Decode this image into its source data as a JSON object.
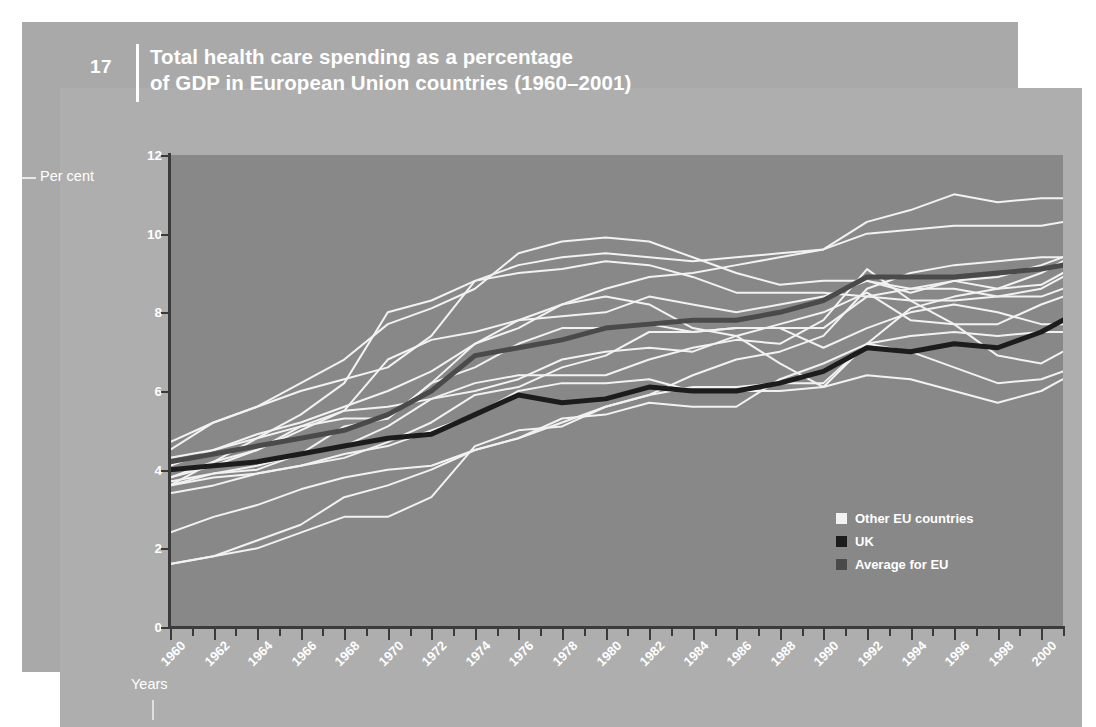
{
  "header": {
    "number": "17",
    "title_line1": "Total health care spending as a percentage",
    "title_line2": "of GDP in European Union countries (1960–2001)"
  },
  "axes": {
    "ylabel": "Per cent",
    "xlabel": "Years"
  },
  "legend": {
    "items": [
      {
        "label": "Other EU countries",
        "color": "#f2f2f2"
      },
      {
        "label": "UK",
        "color": "#1c1c1c"
      },
      {
        "label": "Average for EU",
        "color": "#4a4a4a"
      }
    ]
  },
  "colors": {
    "page_background": "#ffffff",
    "back_panel": "#a9a9a9",
    "front_panel": "#aeaeae",
    "plot_background": "#888888",
    "axis": "#3b3b3b",
    "text": "#ffffff",
    "other_countries": "#f2f2f2",
    "uk": "#1c1c1c",
    "eu_average": "#4a4a4a"
  },
  "chart_data": {
    "type": "line",
    "title": "Total health care spending as a percentage of GDP in European Union countries (1960–2001)",
    "xlabel": "Years",
    "ylabel": "Per cent",
    "xlim": [
      1960,
      2001
    ],
    "ylim": [
      0,
      12
    ],
    "yticks": [
      0,
      2,
      4,
      6,
      8,
      10,
      12
    ],
    "xticks": [
      1960,
      1962,
      1964,
      1966,
      1968,
      1970,
      1972,
      1974,
      1976,
      1978,
      1980,
      1982,
      1984,
      1986,
      1988,
      1990,
      1992,
      1994,
      1996,
      1998,
      2000
    ],
    "xtick_labels": [
      "1960",
      "1962",
      "1964",
      "1966",
      "1968",
      "1970",
      "1972",
      "1974",
      "1976",
      "1978",
      "1980",
      "1982",
      "1984",
      "1986",
      "1988",
      "1990",
      "1992",
      "1994",
      "1996",
      "1998",
      "2000"
    ],
    "grid": false,
    "legend_position": "lower right",
    "x": [
      1960,
      1962,
      1964,
      1966,
      1968,
      1970,
      1972,
      1974,
      1976,
      1978,
      1980,
      1982,
      1984,
      1986,
      1988,
      1990,
      1992,
      1994,
      1996,
      1998,
      2000,
      2001
    ],
    "series": [
      {
        "name": "UK",
        "group": "uk",
        "color": "#1c1c1c",
        "width": 5,
        "values": [
          4.0,
          4.1,
          4.2,
          4.4,
          4.6,
          4.8,
          4.9,
          5.4,
          5.9,
          5.7,
          5.8,
          6.1,
          6.0,
          6.0,
          6.2,
          6.5,
          7.1,
          7.0,
          7.2,
          7.1,
          7.5,
          7.8
        ]
      },
      {
        "name": "Average for EU",
        "group": "eu_average",
        "color": "#4a4a4a",
        "width": 5,
        "values": [
          4.2,
          4.4,
          4.6,
          4.8,
          5.0,
          5.4,
          6.0,
          6.9,
          7.1,
          7.3,
          7.6,
          7.7,
          7.8,
          7.8,
          8.0,
          8.3,
          8.9,
          8.9,
          8.9,
          9.0,
          9.1,
          9.2
        ]
      },
      {
        "name": "Germany",
        "group": "other",
        "color": "#f2f2f2",
        "width": 2,
        "values": [
          4.7,
          5.2,
          5.6,
          6.0,
          6.3,
          6.6,
          7.4,
          8.8,
          9.2,
          9.4,
          9.5,
          9.4,
          9.3,
          9.4,
          9.5,
          9.6,
          10.3,
          10.6,
          11.0,
          10.8,
          10.9,
          10.9
        ]
      },
      {
        "name": "France",
        "group": "other",
        "color": "#f2f2f2",
        "width": 2,
        "values": [
          4.1,
          4.5,
          4.9,
          5.2,
          5.6,
          6.0,
          6.5,
          7.2,
          7.8,
          8.2,
          8.6,
          8.9,
          9.0,
          9.2,
          9.4,
          9.6,
          10.0,
          10.1,
          10.2,
          10.2,
          10.2,
          10.3
        ]
      },
      {
        "name": "Sweden",
        "group": "other",
        "color": "#f2f2f2",
        "width": 2,
        "values": [
          4.5,
          5.2,
          5.6,
          6.2,
          6.8,
          7.7,
          8.1,
          8.6,
          9.5,
          9.8,
          9.9,
          9.8,
          9.4,
          9.0,
          8.7,
          8.8,
          8.8,
          8.5,
          8.8,
          8.9,
          9.2,
          9.4
        ]
      },
      {
        "name": "Denmark",
        "group": "other",
        "color": "#f2f2f2",
        "width": 2,
        "values": [
          3.6,
          4.2,
          4.8,
          5.4,
          6.2,
          8.0,
          8.3,
          8.8,
          9.0,
          9.1,
          9.3,
          9.2,
          8.9,
          8.5,
          8.5,
          8.5,
          8.4,
          8.3,
          8.3,
          8.4,
          8.4,
          8.6
        ]
      },
      {
        "name": "Netherlands",
        "group": "other",
        "color": "#f2f2f2",
        "width": 2,
        "values": [
          3.8,
          4.1,
          4.5,
          5.0,
          5.5,
          6.8,
          7.3,
          7.5,
          7.8,
          7.9,
          8.0,
          8.4,
          8.2,
          8.0,
          8.2,
          8.4,
          8.8,
          8.6,
          8.6,
          8.4,
          8.6,
          8.9
        ]
      },
      {
        "name": "Belgium",
        "group": "other",
        "color": "#f2f2f2",
        "width": 2,
        "values": [
          3.4,
          3.6,
          3.9,
          4.1,
          4.3,
          4.7,
          5.2,
          5.9,
          6.1,
          6.6,
          6.9,
          7.5,
          7.5,
          7.6,
          7.6,
          7.6,
          8.4,
          8.6,
          8.8,
          8.6,
          8.7,
          9.0
        ]
      },
      {
        "name": "Austria",
        "group": "other",
        "color": "#f2f2f2",
        "width": 2,
        "values": [
          4.3,
          4.5,
          4.8,
          5.1,
          5.3,
          5.3,
          6.2,
          6.6,
          7.2,
          7.6,
          7.6,
          7.7,
          7.5,
          7.6,
          7.6,
          7.1,
          7.6,
          8.0,
          8.2,
          8.0,
          7.7,
          7.7
        ]
      },
      {
        "name": "Italy",
        "group": "other",
        "color": "#f2f2f2",
        "width": 2,
        "values": [
          3.6,
          3.9,
          4.1,
          4.4,
          4.6,
          5.1,
          5.8,
          6.0,
          6.3,
          6.8,
          7.0,
          7.1,
          7.0,
          7.4,
          7.7,
          8.0,
          8.5,
          7.8,
          7.7,
          7.7,
          8.2,
          8.4
        ]
      },
      {
        "name": "Finland",
        "group": "other",
        "color": "#f2f2f2",
        "width": 2,
        "values": [
          3.8,
          4.2,
          4.5,
          5.1,
          5.5,
          5.6,
          5.8,
          6.2,
          6.4,
          6.4,
          6.4,
          6.8,
          7.1,
          7.3,
          7.2,
          7.8,
          9.1,
          8.3,
          7.7,
          6.9,
          6.7,
          7.0
        ]
      },
      {
        "name": "Ireland",
        "group": "other",
        "color": "#f2f2f2",
        "width": 2,
        "values": [
          3.7,
          3.9,
          4.0,
          4.4,
          5.1,
          5.3,
          6.2,
          7.2,
          7.6,
          8.2,
          8.4,
          8.2,
          7.6,
          7.4,
          6.7,
          6.1,
          7.2,
          7.0,
          6.6,
          6.2,
          6.3,
          6.5
        ]
      },
      {
        "name": "Spain",
        "group": "other",
        "color": "#f2f2f2",
        "width": 2,
        "values": [
          1.6,
          1.8,
          2.2,
          2.6,
          3.3,
          3.6,
          4.0,
          4.5,
          4.8,
          5.3,
          5.4,
          5.7,
          5.6,
          5.6,
          6.3,
          6.7,
          7.2,
          7.4,
          7.5,
          7.4,
          7.5,
          7.5
        ]
      },
      {
        "name": "Portugal",
        "group": "other",
        "color": "#f2f2f2",
        "width": 2,
        "values": [
          1.6,
          1.8,
          2.0,
          2.4,
          2.8,
          2.8,
          3.3,
          4.6,
          5.0,
          5.1,
          5.6,
          5.9,
          6.1,
          6.1,
          6.2,
          6.2,
          7.2,
          8.1,
          8.4,
          8.6,
          9.0,
          9.3
        ]
      },
      {
        "name": "Greece",
        "group": "other",
        "color": "#f2f2f2",
        "width": 2,
        "values": [
          2.4,
          2.8,
          3.1,
          3.5,
          3.8,
          4.0,
          4.1,
          4.5,
          4.8,
          5.2,
          5.6,
          5.9,
          6.4,
          6.8,
          7.0,
          7.4,
          8.6,
          9.0,
          9.2,
          9.3,
          9.4,
          9.4
        ]
      },
      {
        "name": "Luxembourg",
        "group": "other",
        "color": "#f2f2f2",
        "width": 2,
        "values": [
          3.6,
          3.8,
          3.9,
          4.1,
          4.4,
          4.6,
          5.0,
          5.4,
          6.0,
          6.2,
          6.2,
          6.3,
          6.0,
          6.0,
          6.0,
          6.1,
          6.4,
          6.3,
          6.0,
          5.7,
          6.0,
          6.3
        ]
      }
    ]
  }
}
